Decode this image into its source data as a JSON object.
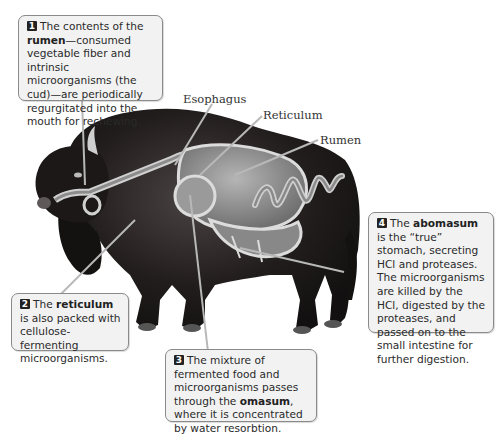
{
  "figure": {
    "labels": [
      {
        "id": "esophagus",
        "text": "Esophagus"
      },
      {
        "id": "reticulum",
        "text": "Reticulum"
      },
      {
        "id": "rumen",
        "text": "Rumen"
      }
    ],
    "callouts": [
      {
        "number": "1",
        "pre": "The contents of the ",
        "bold": "rumen",
        "post": "—consumed vegetable fiber and intrinsic microorganisms (the cud)—are periodically regurgitated into the mouth for rechewing."
      },
      {
        "number": "2",
        "pre": "The ",
        "bold": "reticulum",
        "post": " is also packed with cellulose-fermenting microorganisms."
      },
      {
        "number": "3",
        "pre": "The mixture of fermented food and microorganisms passes through the ",
        "bold": "omasum",
        "post": ", where it is concentrated by water resorbtion."
      },
      {
        "number": "4",
        "pre": "The ",
        "bold": "abomasum",
        "post": " is the “true” stomach, secreting HCl and proteases. The microorganisms are killed by the HCl, digested by the proteases, and passed on to the small intestine for further digestion."
      }
    ],
    "colors": {
      "fur": "#1e1a1a",
      "stomach_fill": "#8f8f8f",
      "stomach_outline": "#d8d8d8",
      "callout_bg": "#f2f2f2",
      "callout_border": "#8a8a8a"
    }
  }
}
